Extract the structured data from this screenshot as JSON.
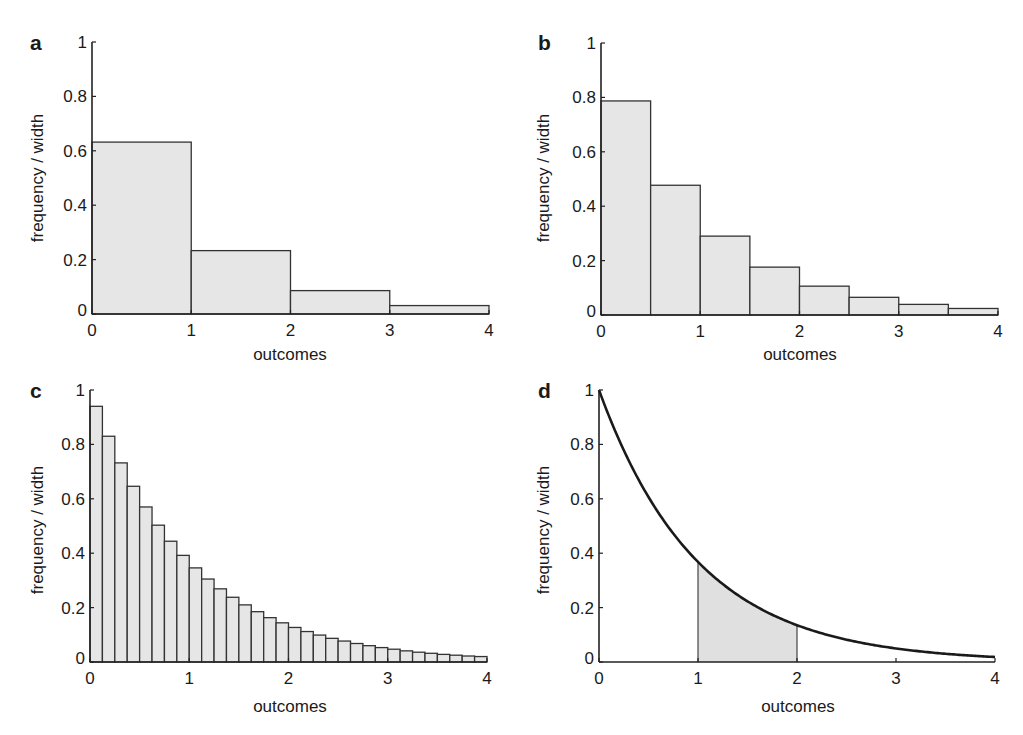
{
  "figure": {
    "panels": [
      {
        "id": "a",
        "letter": "a",
        "xlabel": "outcomes",
        "ylabel": "frequency / width"
      },
      {
        "id": "b",
        "letter": "b",
        "xlabel": "outcomes",
        "ylabel": "frequency / width"
      },
      {
        "id": "c",
        "letter": "c",
        "xlabel": "outcomes",
        "ylabel": "frequency / width"
      },
      {
        "id": "d",
        "letter": "d",
        "xlabel": "outcomes",
        "ylabel": "frequency / width"
      }
    ],
    "xticks": [
      "0",
      "1",
      "2",
      "3",
      "4"
    ],
    "yticks": [
      "0",
      "0.2",
      "0.4",
      "0.6",
      "0.8",
      "1"
    ],
    "colors": {
      "bar_fill": "#e6e6e6",
      "bar_stroke": "#333333",
      "curve": "#1a1a1a",
      "shade": "#e0e0e0"
    }
  },
  "chart_data": [
    {
      "panel": "a",
      "type": "bar",
      "title": "",
      "xlabel": "outcomes",
      "ylabel": "frequency / width",
      "xlim": [
        0,
        4
      ],
      "ylim": [
        0,
        1
      ],
      "bin_width": 1,
      "bin_edges": [
        0,
        1,
        2,
        3,
        4
      ],
      "values": [
        0.632,
        0.233,
        0.086,
        0.031
      ],
      "grid": false
    },
    {
      "panel": "b",
      "type": "bar",
      "title": "",
      "xlabel": "outcomes",
      "ylabel": "frequency / width",
      "xlim": [
        0,
        4
      ],
      "ylim": [
        0,
        1
      ],
      "bin_width": 0.5,
      "bin_edges": [
        0,
        0.5,
        1,
        1.5,
        2,
        2.5,
        3,
        3.5,
        4
      ],
      "values": [
        0.787,
        0.477,
        0.29,
        0.176,
        0.106,
        0.065,
        0.039,
        0.024
      ],
      "grid": false
    },
    {
      "panel": "c",
      "type": "bar",
      "title": "",
      "xlabel": "outcomes",
      "ylabel": "frequency / width",
      "xlim": [
        0,
        4
      ],
      "ylim": [
        0,
        1
      ],
      "bin_width": 0.125,
      "values": [
        0.94,
        0.83,
        0.732,
        0.646,
        0.57,
        0.503,
        0.444,
        0.392,
        0.346,
        0.305,
        0.269,
        0.238,
        0.21,
        0.185,
        0.163,
        0.144,
        0.127,
        0.112,
        0.099,
        0.087,
        0.077,
        0.068,
        0.06,
        0.053,
        0.047,
        0.041,
        0.036,
        0.032,
        0.028,
        0.025,
        0.022,
        0.02
      ],
      "grid": false
    },
    {
      "panel": "d",
      "type": "area",
      "title": "",
      "xlabel": "outcomes",
      "ylabel": "frequency / width",
      "xlim": [
        0,
        4
      ],
      "ylim": [
        0,
        1
      ],
      "function": "exp(-x)",
      "x": [
        0,
        0.5,
        1,
        1.5,
        2,
        2.5,
        3,
        3.5,
        4
      ],
      "y": [
        1.0,
        0.607,
        0.368,
        0.223,
        0.135,
        0.082,
        0.05,
        0.03,
        0.018
      ],
      "shaded_interval": [
        1,
        2
      ],
      "grid": false
    }
  ]
}
